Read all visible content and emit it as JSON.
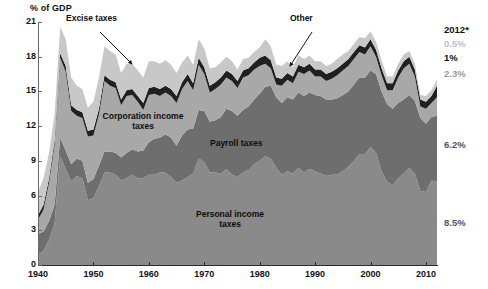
{
  "chart_data": {
    "type": "area",
    "stacked": true,
    "title": "",
    "ylabel": "% of GDP",
    "xlabel": "",
    "xlim": [
      1940,
      2012
    ],
    "ylim": [
      0,
      21
    ],
    "yticks": [
      0,
      3,
      6,
      9,
      12,
      15,
      18,
      21
    ],
    "xticks": [
      1940,
      1950,
      1960,
      1970,
      1980,
      1990,
      2000,
      2010
    ],
    "grid": false,
    "legend_position": "inline-annotations",
    "x": [
      1940,
      1941,
      1942,
      1943,
      1944,
      1945,
      1946,
      1947,
      1948,
      1949,
      1950,
      1951,
      1952,
      1953,
      1954,
      1955,
      1956,
      1957,
      1958,
      1959,
      1960,
      1961,
      1962,
      1963,
      1964,
      1965,
      1966,
      1967,
      1968,
      1969,
      1970,
      1971,
      1972,
      1973,
      1974,
      1975,
      1976,
      1977,
      1978,
      1979,
      1980,
      1981,
      1982,
      1983,
      1984,
      1985,
      1986,
      1987,
      1988,
      1989,
      1990,
      1991,
      1992,
      1993,
      1994,
      1995,
      1996,
      1997,
      1998,
      1999,
      2000,
      2001,
      2002,
      2003,
      2004,
      2005,
      2006,
      2007,
      2008,
      2009,
      2010,
      2011,
      2012
    ],
    "series": [
      {
        "name": "Personal income taxes",
        "color": "#8a8a8a",
        "values": [
          0.9,
          1.2,
          2.2,
          3.6,
          9.4,
          8.3,
          7.2,
          7.7,
          7.5,
          5.6,
          5.8,
          6.8,
          8.0,
          8.0,
          7.8,
          7.3,
          7.5,
          7.8,
          7.5,
          7.5,
          7.8,
          7.8,
          8.0,
          8.0,
          7.6,
          7.1,
          7.3,
          7.6,
          7.9,
          9.2,
          8.9,
          8.0,
          8.0,
          7.9,
          8.3,
          7.8,
          7.6,
          8.0,
          8.2,
          8.7,
          9.0,
          9.4,
          9.2,
          8.4,
          7.8,
          8.1,
          7.9,
          8.4,
          8.0,
          8.3,
          8.1,
          7.9,
          7.7,
          7.8,
          7.8,
          8.1,
          8.5,
          9.0,
          9.6,
          9.6,
          10.2,
          9.7,
          8.1,
          7.2,
          6.9,
          7.5,
          7.9,
          8.4,
          7.9,
          6.4,
          6.3,
          7.3,
          7.2
        ]
      },
      {
        "name": "Payroll taxes",
        "color": "#6e6e6e",
        "values": [
          1.8,
          1.7,
          1.6,
          1.6,
          1.6,
          1.6,
          1.5,
          1.5,
          1.5,
          1.5,
          1.6,
          1.8,
          1.8,
          1.8,
          1.9,
          2.0,
          2.2,
          2.2,
          2.3,
          2.4,
          2.8,
          3.1,
          3.0,
          3.3,
          3.4,
          3.2,
          3.9,
          4.1,
          3.9,
          4.2,
          4.4,
          4.4,
          4.5,
          4.9,
          5.2,
          5.5,
          5.3,
          5.4,
          5.5,
          5.6,
          5.8,
          6.0,
          6.3,
          6.1,
          6.2,
          6.4,
          6.4,
          6.5,
          6.6,
          6.6,
          6.6,
          6.7,
          6.6,
          6.5,
          6.6,
          6.6,
          6.5,
          6.6,
          6.6,
          6.6,
          6.6,
          6.8,
          6.9,
          6.7,
          6.6,
          6.5,
          6.4,
          6.3,
          6.3,
          6.3,
          5.9,
          5.5,
          5.7
        ]
      },
      {
        "name": "Corporation income taxes",
        "color": "#a8a8a8",
        "values": [
          1.2,
          1.9,
          3.3,
          5.2,
          6.9,
          6.8,
          4.6,
          3.7,
          3.7,
          4.0,
          3.8,
          4.4,
          6.1,
          5.7,
          5.6,
          4.5,
          4.9,
          4.7,
          4.3,
          3.5,
          4.1,
          3.9,
          3.6,
          3.6,
          3.6,
          3.7,
          4.0,
          4.2,
          3.3,
          3.9,
          3.2,
          2.5,
          2.7,
          2.8,
          2.7,
          2.6,
          2.4,
          2.8,
          2.7,
          2.6,
          2.4,
          2.0,
          1.5,
          1.1,
          1.5,
          1.5,
          1.4,
          1.8,
          1.9,
          1.9,
          1.6,
          1.7,
          1.6,
          1.8,
          2.0,
          2.1,
          2.2,
          2.2,
          2.2,
          2.0,
          2.1,
          1.5,
          1.4,
          1.2,
          1.6,
          2.2,
          2.7,
          2.7,
          2.1,
          1.0,
          1.3,
          1.2,
          1.6
        ]
      },
      {
        "name": "Other",
        "color": "#202020",
        "values": [
          0.4,
          0.4,
          0.4,
          0.4,
          0.4,
          0.5,
          0.5,
          0.5,
          0.5,
          0.5,
          0.5,
          0.5,
          0.5,
          0.5,
          0.5,
          0.5,
          0.5,
          0.5,
          0.5,
          0.6,
          0.6,
          0.6,
          0.6,
          0.6,
          0.6,
          0.6,
          0.6,
          0.6,
          0.6,
          0.6,
          0.6,
          0.6,
          0.6,
          0.6,
          0.6,
          0.6,
          0.6,
          0.6,
          0.6,
          0.6,
          0.7,
          0.7,
          0.7,
          0.6,
          0.6,
          0.6,
          0.6,
          0.6,
          0.6,
          0.6,
          0.6,
          0.6,
          0.6,
          0.6,
          0.6,
          0.6,
          0.6,
          0.6,
          0.6,
          0.6,
          0.6,
          0.6,
          0.6,
          0.6,
          0.6,
          0.6,
          0.6,
          0.6,
          0.6,
          0.6,
          0.6,
          0.6,
          1.0
        ]
      },
      {
        "name": "Excise taxes",
        "color": "#c8c8c8",
        "values": [
          2.0,
          2.3,
          2.2,
          2.3,
          2.3,
          2.3,
          2.4,
          2.1,
          2.0,
          2.0,
          2.4,
          2.7,
          2.5,
          2.5,
          2.4,
          2.3,
          2.3,
          2.2,
          2.2,
          2.2,
          2.3,
          2.2,
          2.2,
          2.2,
          2.1,
          2.0,
          1.7,
          1.6,
          1.6,
          1.6,
          1.6,
          1.5,
          1.3,
          1.3,
          1.2,
          1.1,
          1.0,
          1.0,
          0.9,
          0.9,
          0.9,
          1.4,
          1.2,
          1.1,
          1.1,
          1.0,
          0.8,
          0.8,
          0.7,
          0.7,
          0.7,
          0.7,
          0.7,
          0.7,
          0.8,
          0.8,
          0.7,
          0.7,
          0.7,
          0.8,
          0.7,
          0.7,
          0.7,
          0.6,
          0.6,
          0.6,
          0.6,
          0.5,
          0.5,
          0.4,
          0.5,
          0.5,
          0.5
        ]
      }
    ],
    "annotations": [
      {
        "name": "excise-taxes",
        "text": "Excise taxes",
        "x": 95,
        "y": 18,
        "arrow_from": [
          100,
          32
        ],
        "arrow_to": [
          132,
          64
        ]
      },
      {
        "name": "other",
        "text": "Other",
        "x": 305,
        "y": 18,
        "arrow_from": [
          312,
          32
        ],
        "arrow_to": [
          290,
          66
        ]
      },
      {
        "name": "corporation-income-taxes",
        "text_line1": "Corporation income",
        "text_line2": "taxes",
        "x": 143,
        "y": 119
      },
      {
        "name": "payroll-taxes",
        "text": "Payroll taxes",
        "x": 249,
        "y": 143
      },
      {
        "name": "personal-income-taxes",
        "text_line1": "Personal income",
        "text_line2": "taxes",
        "x": 230,
        "y": 215
      }
    ],
    "side_labels": [
      {
        "name": "year-header",
        "text": "2012*",
        "color": "#111111",
        "top": 25
      },
      {
        "name": "excise-value",
        "text": "0.5%",
        "color": "#c0c0c0",
        "top": 39
      },
      {
        "name": "other-value",
        "text": "1%",
        "color": "#111111",
        "top": 53
      },
      {
        "name": "corporation-value",
        "text": "2.3%",
        "color": "#9a9a9a",
        "top": 69
      },
      {
        "name": "payroll-value",
        "text": "6.2%",
        "color": "#555555",
        "top": 140
      },
      {
        "name": "personal-value",
        "text": "8.5%",
        "color": "#555555",
        "top": 218
      }
    ]
  },
  "colors": {
    "excise": "#c8c8c8",
    "other": "#202020",
    "corporation": "#a8a8a8",
    "payroll": "#6e6e6e",
    "personal": "#8a8a8a",
    "axis": "#2b2b2b",
    "background": "#ffffff"
  }
}
